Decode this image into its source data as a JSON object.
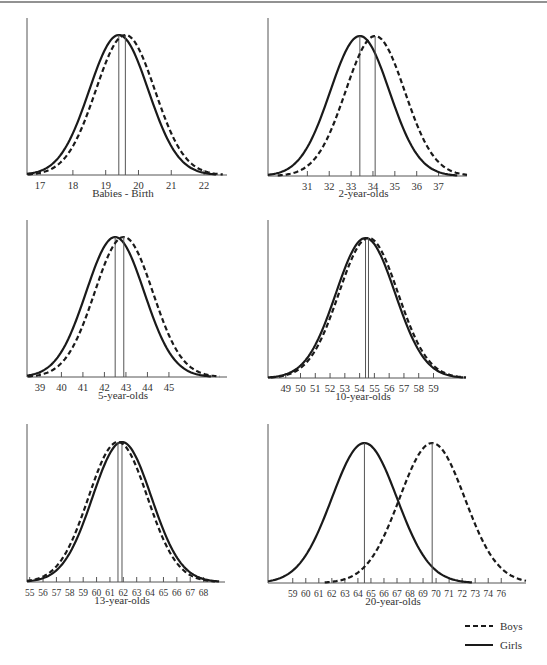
{
  "figure": {
    "border_color": "#6e6e6e",
    "line_color": "#1a1a1a",
    "mean_line_color": "#555555",
    "text_color": "#333333"
  },
  "legend": {
    "items": [
      {
        "label": "Boys",
        "style": "dashed"
      },
      {
        "label": "Girls",
        "style": "solid"
      }
    ]
  },
  "chart_data": [
    {
      "type": "line",
      "title": "Babies - Birth",
      "xlabel": "Babies - Birth",
      "ylabel": "",
      "tick_labels": [
        "17",
        "18",
        "19",
        "20",
        "21",
        "22"
      ],
      "ticks": [
        17,
        18,
        19,
        20,
        21,
        22
      ],
      "xlim": [
        16.6,
        22.7
      ],
      "grid": false,
      "legend_position": "bottom-right of figure",
      "series": [
        {
          "name": "Girls",
          "style": "solid",
          "distribution": "normal",
          "mean": 19.4,
          "sd": 0.9
        },
        {
          "name": "Boys",
          "style": "dashed",
          "distribution": "normal",
          "mean": 19.6,
          "sd": 0.9
        }
      ]
    },
    {
      "type": "line",
      "title": "2-year-olds",
      "xlabel": "2-year-olds",
      "ylabel": "",
      "tick_labels": [
        "31",
        "32",
        "33",
        "34",
        "35",
        "36",
        "37"
      ],
      "ticks": [
        31,
        32,
        33,
        34,
        35,
        36,
        37
      ],
      "xlim": [
        29.2,
        38.3
      ],
      "grid": false,
      "series": [
        {
          "name": "Girls",
          "style": "solid",
          "distribution": "normal",
          "mean": 33.4,
          "sd": 1.35
        },
        {
          "name": "Boys",
          "style": "dashed",
          "distribution": "normal",
          "mean": 34.1,
          "sd": 1.35
        }
      ]
    },
    {
      "type": "line",
      "title": "5-year-olds",
      "xlabel": "5-year-olds",
      "ylabel": "",
      "tick_labels": [
        "39",
        "40",
        "41",
        "42",
        "43",
        "44",
        "45"
      ],
      "ticks": [
        39,
        40,
        41,
        42,
        43,
        44,
        45
      ],
      "xlim": [
        38.4,
        47.7
      ],
      "grid": false,
      "series": [
        {
          "name": "Girls",
          "style": "solid",
          "distribution": "normal",
          "mean": 42.5,
          "sd": 1.35
        },
        {
          "name": "Boys",
          "style": "dashed",
          "distribution": "normal",
          "mean": 42.9,
          "sd": 1.35
        }
      ]
    },
    {
      "type": "line",
      "title": "10-year-olds",
      "xlabel": "10-year-olds",
      "ylabel": "",
      "tick_labels": [
        "49",
        "50",
        "51",
        "52",
        "53",
        "54",
        "55",
        "56",
        "57",
        "58",
        "59"
      ],
      "ticks": [
        49,
        50,
        51,
        52,
        53,
        54,
        55,
        56,
        57,
        58,
        59
      ],
      "xlim": [
        47.8,
        61.2
      ],
      "grid": false,
      "series": [
        {
          "name": "Girls",
          "style": "solid",
          "distribution": "normal",
          "mean": 54.4,
          "sd": 2.0
        },
        {
          "name": "Boys",
          "style": "dashed",
          "distribution": "normal",
          "mean": 54.6,
          "sd": 2.0
        }
      ]
    },
    {
      "type": "line",
      "title": "13-year-olds",
      "xlabel": "13-year-olds",
      "ylabel": "",
      "tick_labels": [
        "55",
        "56",
        "57",
        "58",
        "59",
        "60",
        "61",
        "62",
        "63",
        "64",
        "65",
        "66",
        "67",
        "68"
      ],
      "ticks": [
        55,
        56,
        57,
        58,
        59,
        60,
        61,
        62,
        63,
        64,
        65,
        66,
        67,
        68
      ],
      "xlim": [
        54.8,
        69.6
      ],
      "grid": false,
      "series": [
        {
          "name": "Girls",
          "style": "solid",
          "distribution": "normal",
          "mean": 61.9,
          "sd": 2.2
        },
        {
          "name": "Boys",
          "style": "dashed",
          "distribution": "normal",
          "mean": 61.6,
          "sd": 2.2
        }
      ]
    },
    {
      "type": "line",
      "title": "20-year-olds",
      "xlabel": "20-year-olds",
      "ylabel": "",
      "tick_labels": [
        "59",
        "60",
        "61",
        "62",
        "63",
        "64",
        "65",
        "66",
        "67",
        "68",
        "69",
        "70",
        "71",
        "72",
        "73",
        "74",
        "76"
      ],
      "ticks": [
        59,
        60,
        61,
        62,
        63,
        64,
        65,
        66,
        67,
        68,
        69,
        70,
        71,
        72,
        73,
        74,
        75
      ],
      "xlim": [
        57.1,
        76.9
      ],
      "grid": false,
      "series": [
        {
          "name": "Girls",
          "style": "solid",
          "distribution": "normal",
          "mean": 64.5,
          "sd": 2.5
        },
        {
          "name": "Boys",
          "style": "dashed",
          "distribution": "normal",
          "mean": 69.7,
          "sd": 2.5
        }
      ]
    }
  ]
}
